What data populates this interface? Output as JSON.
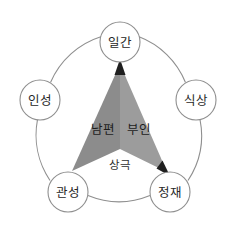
{
  "page": {
    "clipped_caption_text": "▫ ▪▪ ▪ ▫"
  },
  "diagram": {
    "type": "five-element-cycle",
    "outer_ring": {
      "stroke_color": "#8f8f8f",
      "fill_color": "#ffffff"
    },
    "nodes": [
      {
        "id": "ilgan",
        "label": "일간",
        "cx": 120,
        "cy": 42,
        "r": 20
      },
      {
        "id": "siksang",
        "label": "식상",
        "cx": 196,
        "cy": 100,
        "r": 20
      },
      {
        "id": "jeongjae",
        "label": "정재",
        "cx": 170,
        "cy": 192,
        "r": 20
      },
      {
        "id": "gwanseong",
        "label": "관성",
        "cx": 68,
        "cy": 192,
        "r": 20
      },
      {
        "id": "inseong",
        "label": "인성",
        "cx": 40,
        "cy": 100,
        "r": 20
      }
    ],
    "center_labels": [
      {
        "id": "nampyeon",
        "text": "남편",
        "x": 103,
        "y": 130
      },
      {
        "id": "buin",
        "text": "부인",
        "x": 139,
        "y": 130
      },
      {
        "id": "sanggeuk",
        "text": "상극",
        "x": 120,
        "y": 165
      }
    ],
    "conflict_shape": {
      "name": "sanggeuk-arrow-wedge",
      "left_fill": "#8c8c8c",
      "right_fill": "#9c9c9c",
      "arrow_fill": "#1f1f1f",
      "apex_top": {
        "x": 120,
        "y": 63
      },
      "apex_right": {
        "x": 168,
        "y": 171
      },
      "notch": {
        "x": 120,
        "y": 149
      },
      "base_left": {
        "x": 72,
        "y": 171
      }
    },
    "colors": {
      "node_stroke": "#8f8f8f",
      "node_fill": "#ffffff",
      "ring_stroke": "#8f8f8f",
      "text": "#272727",
      "background": "#ffffff"
    }
  }
}
